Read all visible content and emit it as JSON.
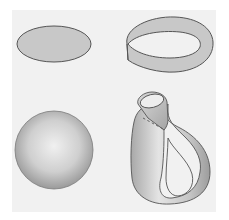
{
  "figure": {
    "background_color": "#f1f1f1",
    "fill_color": "#c8c8c8",
    "stroke_color": "#555555",
    "shapes": [
      {
        "id": "disk",
        "position": "top-left"
      },
      {
        "id": "mobius-strip",
        "position": "top-right"
      },
      {
        "id": "sphere",
        "position": "bottom-left"
      },
      {
        "id": "klein-bottle",
        "position": "bottom-right"
      }
    ]
  }
}
